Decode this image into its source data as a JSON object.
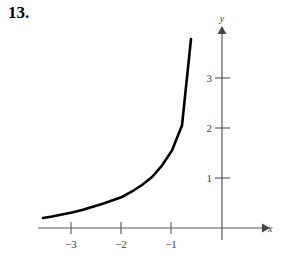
{
  "problem": {
    "number": "13."
  },
  "figure": {
    "x_axis_label": "x",
    "y_axis_label": "y",
    "x_tick_labels": [
      "−3",
      "−2",
      "−1"
    ],
    "y_tick_labels": [
      "1",
      "2",
      "3"
    ],
    "axis_color": "#555555",
    "curve_color": "#000000"
  },
  "chart_data": {
    "type": "line",
    "title": "",
    "xlabel": "x",
    "ylabel": "y",
    "xlim": [
      -3.7,
      0.9
    ],
    "ylim": [
      -0.2,
      4.1
    ],
    "grid": false,
    "legend": null,
    "categories": null,
    "x_ticks": [
      -3,
      -2,
      -1
    ],
    "y_ticks": [
      1,
      2,
      3
    ],
    "x_tick_labels": [
      "−3",
      "−2",
      "−1"
    ],
    "y_tick_labels": [
      "1",
      "2",
      "3"
    ],
    "annotations": [],
    "series": [
      {
        "name": "exponential curve",
        "x": [
          -3.58,
          -3.4,
          -3.2,
          -3.0,
          -2.8,
          -2.6,
          -2.4,
          -2.2,
          -2.0,
          -1.8,
          -1.6,
          -1.4,
          -1.2,
          -1.0,
          -0.8,
          -0.62
        ],
        "values": [
          0.2,
          0.23,
          0.27,
          0.31,
          0.36,
          0.42,
          0.48,
          0.55,
          0.62,
          0.73,
          0.86,
          1.02,
          1.25,
          1.55,
          2.05,
          3.78
        ]
      }
    ]
  }
}
